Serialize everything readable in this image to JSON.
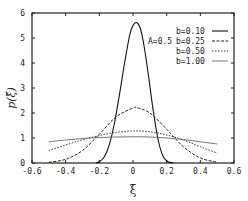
{
  "chart_data": {
    "type": "line",
    "title": "",
    "xlabel": "ξ̄",
    "ylabel": "p(ξ̄)",
    "xlim": [
      -0.6,
      0.6
    ],
    "ylim": [
      0,
      6
    ],
    "xticks": [
      "-0.6",
      "-0.4",
      "-0.2",
      "0",
      "0.2",
      "0.4",
      "0.6"
    ],
    "yticks": [
      "0",
      "1",
      "2",
      "3",
      "4",
      "5",
      "6"
    ],
    "grid": false,
    "legend_position": "upper right",
    "annotation": "A=0.5",
    "series": [
      {
        "name": "b=0.10",
        "style": "solid",
        "x": [
          -0.22,
          -0.2,
          -0.17,
          -0.14,
          -0.11,
          -0.08,
          -0.05,
          -0.02,
          0.0,
          0.02,
          0.04,
          0.06,
          0.09,
          0.12,
          0.15,
          0.18,
          0.21,
          0.24
        ],
        "y": [
          0.0,
          0.05,
          0.25,
          0.75,
          1.6,
          2.75,
          4.0,
          5.1,
          5.5,
          5.62,
          5.45,
          4.9,
          3.6,
          2.1,
          0.9,
          0.25,
          0.05,
          0.0
        ]
      },
      {
        "name": "b=0.25",
        "style": "dashed",
        "x": [
          -0.5,
          -0.4,
          -0.3,
          -0.2,
          -0.1,
          0.0,
          0.02,
          0.1,
          0.2,
          0.3,
          0.4,
          0.5
        ],
        "y": [
          0.03,
          0.15,
          0.5,
          1.15,
          1.85,
          2.2,
          2.22,
          2.0,
          1.35,
          0.65,
          0.2,
          0.03
        ]
      },
      {
        "name": "b=0.50",
        "style": "dotted",
        "x": [
          -0.5,
          -0.4,
          -0.3,
          -0.2,
          -0.1,
          0.0,
          0.1,
          0.2,
          0.3,
          0.4,
          0.5
        ],
        "y": [
          0.5,
          0.72,
          0.93,
          1.1,
          1.23,
          1.28,
          1.25,
          1.12,
          0.92,
          0.65,
          0.4
        ]
      },
      {
        "name": "b=1.00",
        "style": "dash-dot-light",
        "x": [
          -0.5,
          -0.4,
          -0.3,
          -0.2,
          -0.1,
          0.0,
          0.1,
          0.2,
          0.3,
          0.4,
          0.5
        ],
        "y": [
          0.85,
          0.92,
          0.98,
          1.02,
          1.04,
          1.05,
          1.04,
          1.0,
          0.94,
          0.85,
          0.76
        ]
      }
    ]
  }
}
